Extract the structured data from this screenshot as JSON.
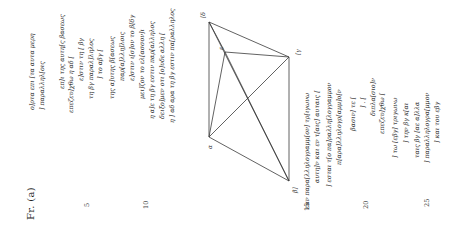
{
  "fragment": {
    "title": "Fr. (a)"
  },
  "lines": [
    {
      "n": 1,
      "text": "ο]ρτα επι [τα αυτα μερη"
    },
    {
      "n": 2,
      "text": "] παραλληλ[οις"
    },
    {
      "n": 3,
      "text": "επ]ι της αυτη[ς βασεως"
    },
    {
      "n": 4,
      "text": "επεζευ]χθω η αδ ["
    },
    {
      "n": 5,
      "text": "ε]στιν τη [ βγ"
    },
    {
      "n": 6,
      "text": "τη βγ παραλ]ληλος"
    },
    {
      "n": 7,
      "text": "] το αβγ ["
    },
    {
      "n": 8,
      "text": "της α]υτης β[ασεως"
    },
    {
      "n": 9,
      "text": "παρ[α]λλη]λοις"
    },
    {
      "n": 10,
      "text": "ε]στιν ι[σ]ον το β[δγ"
    },
    {
      "n": 11,
      "text": "μει]ζον το ελ[ασσον]ι"
    },
    {
      "n": 12,
      "text": "η α]ε τη βγ εστιν παρ[αλληλος"
    },
    {
      "n": 13,
      "text": "δειξο]μεν οτι [ο]υδε αλλη ["
    },
    {
      "n": 14,
      "text": "η ] αδ αρα τη βγ εστιν πα[ραλληλος"
    },
    {
      "n": 15,
      "text": "εαν παρα[λληλογραμμ[ον] τρ[ιγωνω"
    },
    {
      "n": 16,
      "text": "αυτη]ν και εν τ[αις] αυταις ["
    },
    {
      "n": 17,
      "text": "] εσται τ[ο πα]ραλλη[λογραμμον"
    },
    {
      "n": 18,
      "text": "π[αρα]λληλογρ[αμμ]ο[ν"
    },
    {
      "n": 19,
      "text": "βασιν] τε ["
    },
    {
      "n": 20,
      "text": "] . ["
    },
    {
      "n": 21,
      "text": "διπλα[σιο]ν"
    },
    {
      "n": 22,
      "text": "επεζευ]χθω ["
    },
    {
      "n": 23,
      "text": "] τω [εβγ] τριγωνω"
    },
    {
      "n": 24,
      "text": "] την βγ κ[αι"
    },
    {
      "n": 25,
      "text": "ταις βγ [αε α]λλα"
    },
    {
      "n": 26,
      "text": "] παραλληλογρα[μμον"
    },
    {
      "n": 27,
      "text": "] και του εβγ"
    }
  ],
  "line_numbers": [
    "5",
    "10",
    "15",
    "20",
    "25"
  ],
  "diagram": {
    "vertices": [
      {
        "id": "delta",
        "label": "[δ"
      },
      {
        "id": "epsilon",
        "label": "ε"
      },
      {
        "id": "gamma",
        "label": "[γ"
      },
      {
        "id": "alpha",
        "label": "α"
      },
      {
        "id": "beta",
        "label": "β]"
      }
    ]
  }
}
